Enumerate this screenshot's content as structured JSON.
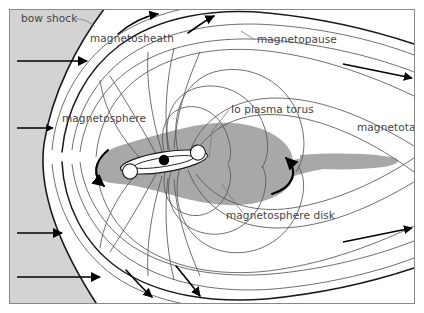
{
  "figure": {
    "width": 424,
    "height": 313
  },
  "colors": {
    "background": "#ffffff",
    "solar_wind_fill": "#d3d3d3",
    "disk_fill": "#a8a8a8",
    "tail_fill": "#a8a8a8",
    "field_line": "#4a4a4a",
    "boundary_line": "#1a1a1a",
    "arrow": "#000000",
    "label_text": "#444444",
    "frame": "#888888",
    "planet": "#000000",
    "torus": "#ffffff"
  },
  "labels": [
    {
      "id": "bow-shock",
      "text": "bow shock",
      "x": 21,
      "y": 22
    },
    {
      "id": "magnetosheath",
      "text": "magnetosheath",
      "x": 90,
      "y": 42
    },
    {
      "id": "magnetopause",
      "text": "magnetopause",
      "x": 257,
      "y": 43
    },
    {
      "id": "magnetosphere",
      "text": "magnetosphere",
      "x": 62,
      "y": 122
    },
    {
      "id": "io-plasma-torus",
      "text": "Io plasma torus",
      "x": 231,
      "y": 113
    },
    {
      "id": "magnetotail",
      "text": "magnetotail",
      "x": 357,
      "y": 131
    },
    {
      "id": "magnetosphere-disk",
      "text": "magnetosphere disk",
      "x": 226,
      "y": 219
    }
  ],
  "regions": [
    {
      "id": "solar-wind",
      "name": "solar wind region"
    },
    {
      "id": "magnetosheath",
      "name": "magnetosheath region"
    },
    {
      "id": "magnetosphere",
      "name": "magnetosphere region"
    },
    {
      "id": "magnetosphere-disk",
      "name": "magnetosphere disk"
    },
    {
      "id": "magnetotail",
      "name": "magnetotail band"
    },
    {
      "id": "io-plasma-torus",
      "name": "Io plasma torus"
    },
    {
      "id": "planet",
      "name": "planet Jupiter"
    }
  ],
  "arrows": {
    "solar_wind": [
      {
        "id": "solar-wind-arrow-1",
        "x1": 17,
        "y1": 61,
        "x2": 87,
        "y2": 61
      },
      {
        "id": "solar-wind-arrow-2",
        "x1": 17,
        "y1": 128,
        "x2": 53,
        "y2": 128
      },
      {
        "id": "solar-wind-arrow-3",
        "x1": 17,
        "y1": 233,
        "x2": 62,
        "y2": 233
      },
      {
        "id": "solar-wind-arrow-4",
        "x1": 17,
        "y1": 277,
        "x2": 100,
        "y2": 277
      }
    ],
    "magnetosheath_flow": [
      {
        "id": "sheath-arrow-upper-left",
        "note": "curving up-right"
      },
      {
        "id": "sheath-arrow-upper-right",
        "note": "curving up-right"
      },
      {
        "id": "sheath-arrow-lower-left",
        "note": "curving down-right"
      },
      {
        "id": "sheath-arrow-lower-right",
        "note": "curving down-right"
      }
    ],
    "tail_flow": [
      {
        "id": "tail-arrow-upper",
        "x1": 343,
        "y1": 64,
        "x2": 414,
        "y2": 76
      },
      {
        "id": "tail-arrow-lower",
        "x1": 343,
        "y1": 240,
        "x2": 414,
        "y2": 228
      }
    ],
    "disk_circulation": [
      {
        "id": "disk-arrow-left",
        "note": "counterclockwise sweep on left lobe"
      },
      {
        "id": "disk-arrow-right",
        "note": "leftward sweep on right lobe"
      }
    ]
  },
  "leader_lines": [
    {
      "id": "bow-shock-leader",
      "from": "bow shock label",
      "to": "bow shock curve"
    },
    {
      "id": "magnetopause-leader",
      "from": "magnetopause label",
      "to": "magnetopause curve"
    },
    {
      "id": "io-plasma-torus-leader",
      "from": "Io plasma torus label",
      "to": "torus"
    },
    {
      "id": "magnetosphere-disk-leader",
      "from": "magnetosphere disk label",
      "to": "disk edge"
    }
  ]
}
